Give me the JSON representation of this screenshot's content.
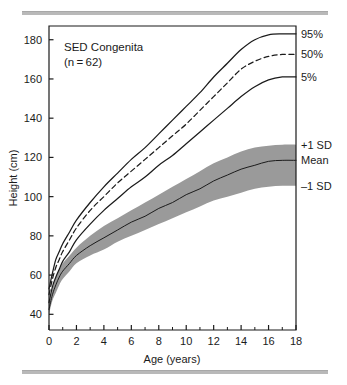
{
  "figure": {
    "annotation_line1": "SED Congenita",
    "annotation_line2": "(n = 62)",
    "divider_color": "#b9b9b9",
    "band_color": "#9a9a9a",
    "line_color": "#1b1b1b"
  },
  "axes": {
    "xlabel": "Age (years)",
    "ylabel": "Height (cm)",
    "xticks": [
      0,
      2,
      4,
      6,
      8,
      10,
      12,
      14,
      16,
      18
    ],
    "xticklabels": [
      "0",
      "2",
      "4",
      "6",
      "8",
      "10",
      "12",
      "14",
      "16",
      "18"
    ],
    "xminor": [
      1,
      3,
      5,
      7,
      9,
      11,
      13,
      15,
      17
    ],
    "yticks": [
      40,
      60,
      80,
      100,
      120,
      140,
      160,
      180
    ],
    "yticklabels": [
      "40",
      "60",
      "80",
      "100",
      "120",
      "140",
      "160",
      "180"
    ],
    "xlim": [
      0,
      18
    ],
    "ylim": [
      32,
      187
    ],
    "grid": false
  },
  "series_labels": {
    "p95": "95%",
    "p50": "50%",
    "p5": "5%",
    "sd_plus": "+1 SD",
    "mean": "Mean",
    "sd_minus": "–1 SD"
  },
  "chart_data": {
    "type": "line",
    "xlabel": "Age (years)",
    "ylabel": "Height (cm)",
    "xlim": [
      0,
      18
    ],
    "ylim": [
      32,
      187
    ],
    "grid": false,
    "legend_position": "right-edge-labels",
    "annotations": [
      "SED Congenita",
      "(n = 62)"
    ],
    "x": [
      0,
      0.25,
      0.5,
      0.75,
      1,
      1.5,
      2,
      3,
      4,
      5,
      6,
      7,
      8,
      9,
      10,
      11,
      12,
      13,
      14,
      15,
      16,
      17,
      18
    ],
    "series": [
      {
        "name": "95%",
        "label": "95%",
        "style": "solid",
        "note": "Normal reference 95th percentile",
        "values": [
          53,
          61,
          68,
          72,
          76,
          82,
          88,
          97,
          105,
          112,
          119,
          125,
          132,
          139,
          146,
          153,
          161,
          168,
          175,
          180,
          182.5,
          183,
          183
        ]
      },
      {
        "name": "50%",
        "label": "50%",
        "style": "dashed",
        "note": "Normal reference 50th percentile",
        "values": [
          50,
          58,
          64,
          68,
          72,
          78,
          84,
          93,
          100,
          107,
          113,
          119,
          125,
          131,
          137,
          144,
          151,
          158,
          165,
          169,
          171.5,
          172.5,
          172.5
        ]
      },
      {
        "name": "5%",
        "label": "5%",
        "style": "solid",
        "note": "Normal reference 5th percentile",
        "values": [
          46,
          54,
          59,
          63,
          67,
          72,
          78,
          86,
          93,
          99,
          105,
          110,
          116,
          121,
          127,
          133,
          139,
          145,
          151,
          156,
          159.5,
          161,
          161
        ]
      },
      {
        "name": "+1 SD",
        "label": "+1 SD",
        "style": "band-upper",
        "note": "SED Congenita mean + 1 SD (upper edge of shaded band)",
        "values": [
          45,
          53,
          59,
          63,
          66,
          70,
          74,
          80,
          85,
          89,
          93,
          97,
          101,
          105,
          109,
          113,
          117,
          120,
          123,
          125,
          126,
          126.5,
          126.5
        ]
      },
      {
        "name": "Mean",
        "label": "Mean",
        "style": "solid-in-band",
        "note": "SED Congenita mean stature",
        "values": [
          42.5,
          50,
          55,
          59,
          62,
          66,
          70,
          75,
          79,
          83,
          87,
          90,
          94,
          97,
          101,
          104,
          108,
          111,
          114,
          116,
          118,
          118.5,
          118.5
        ]
      },
      {
        "name": "–1 SD",
        "label": "–1 SD",
        "style": "band-lower",
        "note": "SED Congenita mean − 1 SD (lower edge of shaded band)",
        "values": [
          40,
          47,
          51,
          55,
          58,
          62,
          66,
          70,
          73,
          77,
          80,
          83,
          86,
          89,
          92,
          95,
          98,
          100,
          102,
          104,
          105,
          105.5,
          105.5
        ]
      }
    ]
  }
}
